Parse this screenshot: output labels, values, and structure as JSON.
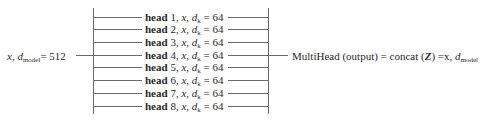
{
  "diagram": {
    "input": {
      "var": "x",
      "dim_symbol": "d",
      "dim_subscript": "model",
      "dim_value": "= 512"
    },
    "heads": [
      {
        "bold": "head",
        "index": "1",
        "var": "x",
        "dk_symbol": "d",
        "dk_subscript": "k",
        "dk_value": "= 64"
      },
      {
        "bold": "head",
        "index": "2",
        "var": "x",
        "dk_symbol": "d",
        "dk_subscript": "k",
        "dk_value": "= 64"
      },
      {
        "bold": "head",
        "index": "3",
        "var": "x",
        "dk_symbol": "d",
        "dk_subscript": "k",
        "dk_value": "= 64"
      },
      {
        "bold": "head",
        "index": "4",
        "var": "x",
        "dk_symbol": "d",
        "dk_subscript": "k",
        "dk_value": "= 64"
      },
      {
        "bold": "head",
        "index": "5",
        "var": "x",
        "dk_symbol": "d",
        "dk_subscript": "k",
        "dk_value": "= 64"
      },
      {
        "bold": "head",
        "index": "6",
        "var": "x",
        "dk_symbol": "d",
        "dk_subscript": "k",
        "dk_value": "= 64"
      },
      {
        "bold": "head",
        "index": "7",
        "var": "x",
        "dk_symbol": "d",
        "dk_subscript": "k",
        "dk_value": "= 64"
      },
      {
        "bold": "head",
        "index": "8",
        "var": "x",
        "dk_symbol": "d",
        "dk_subscript": "k",
        "dk_value": "= 64"
      }
    ],
    "output": {
      "prefix": "MultiHead (output) = concat (",
      "z": "Z",
      "suffix": ") =x, ",
      "dim_symbol": "d",
      "dim_subscript": "model"
    },
    "line_color": "#6a6a6a"
  }
}
